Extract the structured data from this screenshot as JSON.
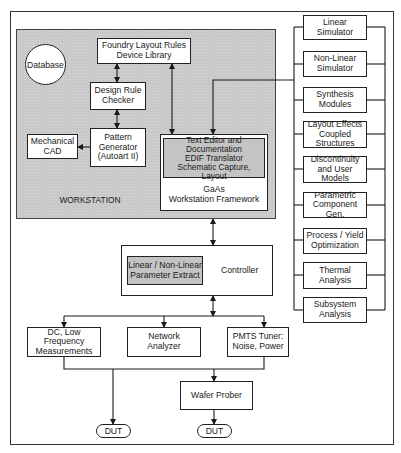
{
  "workstation": {
    "label": "WORKSTATION",
    "database": "Database",
    "foundry": "Foundry Layout Rules\nDevice Library",
    "drc": "Design Rule\nChecker",
    "pattern_generator": "Pattern\nGenerator\n(Autoart II)",
    "mechanical_cad": "Mechanical\nCAD",
    "framework_tools": "Text Editor and\nDocumentation\nEDIF Translator\nSchematic Capture, Layout",
    "framework": "GaAs\nWorkstation Framework"
  },
  "modules": [
    "Linear\nSimulator",
    "Non-Linear\nSimulator",
    "Synthesis\nModules",
    "Layout Effects\nCoupled\nStructures",
    "Discontinuity\nand User\nModels",
    "Parametric\nComponent Gen.",
    "Process / Yield\nOptimization",
    "Thermal\nAnalysis",
    "Subsystem\nAnalysis"
  ],
  "controller": {
    "label": "Controller",
    "param_extract": "Linear / Non-Linear\nParameter Extract"
  },
  "instruments": {
    "dc": "DC, Low Frequency\nMeasurements",
    "network": "Network\nAnalyzer",
    "pmts": "PMTS Tuner:\nNoise, Power",
    "wafer_prober": "Wafer Prober",
    "dut_left": "DUT",
    "dut_right": "DUT"
  },
  "colors": {
    "panel_fill": "#c9c9c9",
    "highlight_fill": "#c4c4c4",
    "line": "#1a1a1a"
  }
}
